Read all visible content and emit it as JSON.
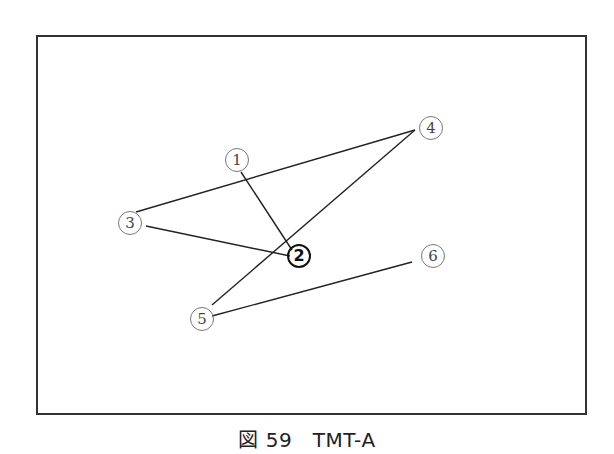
{
  "figure": {
    "caption": "図 59　TMT-A",
    "frame": {
      "x": 37,
      "y": 36,
      "width": 549,
      "height": 378,
      "stroke": "#333333"
    }
  },
  "nodes": [
    {
      "id": 1,
      "label": "1",
      "x": 237,
      "y": 160,
      "emphasized": false
    },
    {
      "id": 2,
      "label": "2",
      "x": 299,
      "y": 256,
      "emphasized": true
    },
    {
      "id": 3,
      "label": "3",
      "x": 130,
      "y": 223,
      "emphasized": false
    },
    {
      "id": 4,
      "label": "4",
      "x": 431,
      "y": 128,
      "emphasized": false
    },
    {
      "id": 5,
      "label": "5",
      "x": 202,
      "y": 319,
      "emphasized": false
    },
    {
      "id": 6,
      "label": "6",
      "x": 433,
      "y": 256,
      "emphasized": false
    }
  ],
  "edges": [
    {
      "from": 1,
      "to": 2,
      "x1": 241,
      "y1": 172,
      "x2": 292,
      "y2": 250
    },
    {
      "from": 2,
      "to": 3,
      "x1": 290,
      "y1": 256,
      "x2": 146,
      "y2": 226
    },
    {
      "from": 3,
      "to": 4,
      "x1": 136,
      "y1": 212,
      "x2": 415,
      "y2": 130
    },
    {
      "from": 4,
      "to": 5,
      "x1": 415,
      "y1": 130,
      "x2": 212,
      "y2": 305
    },
    {
      "from": 5,
      "to": 6,
      "x1": 212,
      "y1": 316,
      "x2": 412,
      "y2": 262
    }
  ],
  "line_color": "#222222"
}
